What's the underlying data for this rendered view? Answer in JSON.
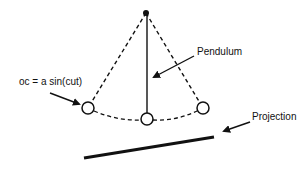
{
  "diagram": {
    "type": "pendulum-projection",
    "labels": {
      "pendulum": "Pendulum",
      "equation": "oc = a sin(cut)",
      "projection": "Projection"
    },
    "colors": {
      "stroke": "#111111",
      "background": "#ffffff"
    },
    "geometry": {
      "pivot": [
        146,
        13
      ],
      "bobs": [
        {
          "name": "left",
          "cx": 88,
          "cy": 108,
          "r": 6
        },
        {
          "name": "center",
          "cx": 147,
          "cy": 119,
          "r": 6
        },
        {
          "name": "right",
          "cx": 203,
          "cy": 108,
          "r": 6
        }
      ],
      "projection_line": [
        [
          84,
          158
        ],
        [
          214,
          137
        ]
      ]
    }
  }
}
